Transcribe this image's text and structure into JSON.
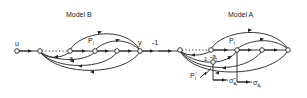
{
  "diagram": {
    "type": "signal-flow-graph",
    "models": [
      {
        "title": "Model B",
        "labels": {
          "input": "u",
          "output": "y",
          "path": "P",
          "path_sub": "i",
          "gain": "-a",
          "gain_sub": "i"
        }
      },
      {
        "title": "Model A",
        "labels": {
          "path": "P",
          "path_sub": "i",
          "gain": "-a",
          "gain_sub": "i",
          "unit": "1",
          "perturbed_path": "P",
          "perturbed_sub": "i",
          "perturbed_prime": "'",
          "sigma_tilde": "σ̃",
          "sigma": "σ",
          "sigma_sub": "a",
          "sigma_subsub": "i"
        }
      }
    ],
    "connector": {
      "gain": "-1"
    }
  }
}
